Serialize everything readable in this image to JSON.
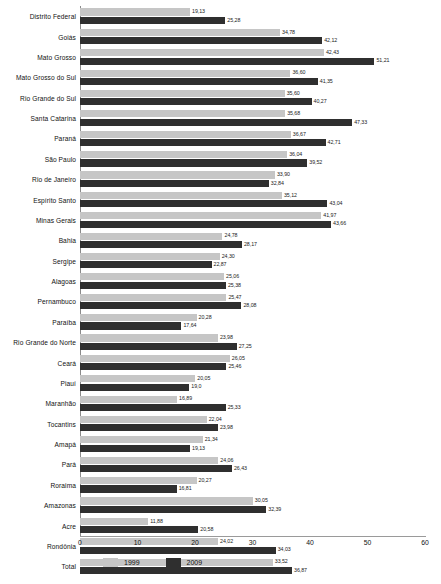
{
  "chart_data": {
    "type": "bar",
    "orientation": "horizontal",
    "title": "",
    "xlabel": "",
    "ylabel": "",
    "xlim": [
      0,
      60
    ],
    "xticks": [
      0,
      10,
      20,
      30,
      40,
      50,
      60
    ],
    "grid": false,
    "legend_position": "bottom",
    "categories": [
      "Distrito Federal",
      "Goiás",
      "Mato Grosso",
      "Mato Grosso do Sul",
      "Rio Grande do Sul",
      "Santa Catarina",
      "Paraná",
      "São Paulo",
      "Rio de Janeiro",
      "Espírito Santo",
      "Minas Gerais",
      "Bahia",
      "Sergipe",
      "Alagoas",
      "Pernambuco",
      "Paraíba",
      "Rio Grande do Norte",
      "Ceará",
      "Piauí",
      "Maranhão",
      "Tocantins",
      "Amapá",
      "Pará",
      "Roraima",
      "Amazonas",
      "Acre",
      "Rondônia",
      "Total"
    ],
    "series": [
      {
        "name": "1999",
        "color": "#c6c6c6",
        "values": [
          19.13,
          34.78,
          42.43,
          36.6,
          35.6,
          35.68,
          36.67,
          36.04,
          33.9,
          35.12,
          41.97,
          24.78,
          24.3,
          25.06,
          25.47,
          20.28,
          23.98,
          26.05,
          20.05,
          16.89,
          22.04,
          21.34,
          24.06,
          20.27,
          30.05,
          11.88,
          24.02,
          33.52
        ],
        "labels": [
          "19,13",
          "34,78",
          "42,43",
          "36,60",
          "35,60",
          "35,68",
          "36,67",
          "36,04",
          "33,90",
          "35,12",
          "41,97",
          "24,78",
          "24,30",
          "25,06",
          "25,47",
          "20,28",
          "23,98",
          "26,05",
          "20,05",
          "16,89",
          "22,04",
          "21,34",
          "24,06",
          "20,27",
          "30,05",
          "11,88",
          "24,02",
          "33,52"
        ]
      },
      {
        "name": "2009",
        "color": "#2f2f2f",
        "values": [
          25.28,
          42.12,
          51.21,
          41.35,
          40.27,
          47.33,
          42.71,
          39.52,
          32.84,
          43.04,
          43.66,
          28.17,
          22.87,
          25.38,
          28.08,
          17.64,
          27.25,
          25.46,
          19.0,
          25.33,
          23.98,
          19.13,
          26.43,
          16.81,
          32.39,
          20.58,
          34.03,
          36.87
        ],
        "labels": [
          "25,28",
          "42,12",
          "51,21",
          "41,35",
          "40,27",
          "47,33",
          "42,71",
          "39,52",
          "32,84",
          "43,04",
          "43,66",
          "28,17",
          "22,87",
          "25,38",
          "28,08",
          "17,64",
          "27,25",
          "25,46",
          "19,0",
          "25,33",
          "23,98",
          "19,13",
          "26,43",
          "16,81",
          "32,39",
          "20,58",
          "34,03",
          "36,87"
        ]
      }
    ]
  },
  "legend": {
    "items": [
      {
        "label": "1999",
        "color": "#c6c6c6"
      },
      {
        "label": "2009",
        "color": "#2f2f2f"
      }
    ]
  }
}
